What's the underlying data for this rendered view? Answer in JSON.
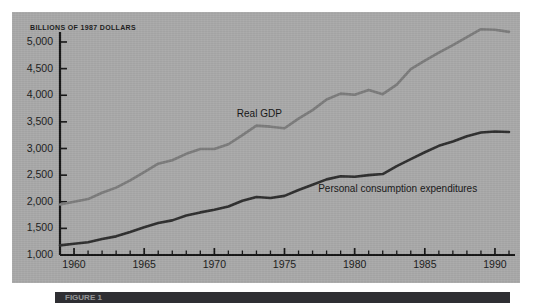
{
  "figure": {
    "panel_background": "#a9a9a9",
    "page_background": "#ffffff",
    "caption_bar_color": "#2f2f33",
    "caption_partial_text": "FIGURE 1"
  },
  "chart_data": {
    "type": "line",
    "title": "",
    "subtitle": "",
    "axis_note": "BILLIONS OF 1987 DOLLARS",
    "xlabel": "",
    "ylabel": "",
    "xlim": [
      1959,
      1991
    ],
    "ylim": [
      1000,
      5000
    ],
    "ytick_step": 500,
    "grid": false,
    "legend": "inline-labels",
    "ytick_labels": [
      "1,000",
      "1,500",
      "2,000",
      "2,500",
      "3,000",
      "3,500",
      "4,000",
      "4,500",
      "5,000"
    ],
    "ytick_values": [
      1000,
      1500,
      2000,
      2500,
      3000,
      3500,
      4000,
      4500,
      5000
    ],
    "xtick_labels": [
      "1960",
      "1965",
      "1970",
      "1975",
      "1980",
      "1985",
      "1990"
    ],
    "xtick_values": [
      1960,
      1965,
      1970,
      1975,
      1980,
      1985,
      1990
    ],
    "xtick_minor_step": 1,
    "x": [
      1959,
      1960,
      1961,
      1962,
      1963,
      1964,
      1965,
      1966,
      1967,
      1968,
      1969,
      1970,
      1971,
      1972,
      1973,
      1974,
      1975,
      1976,
      1977,
      1978,
      1979,
      1980,
      1981,
      1982,
      1983,
      1984,
      1985,
      1986,
      1987,
      1988,
      1989,
      1990,
      1991
    ],
    "series": [
      {
        "name": "Real GDP",
        "color": "#7c7c7c",
        "label_x": 1971.6,
        "label_y": 3620,
        "values": [
          1950,
          2000,
          2050,
          2170,
          2265,
          2400,
          2555,
          2715,
          2780,
          2900,
          2990,
          2990,
          3080,
          3250,
          3430,
          3410,
          3380,
          3560,
          3720,
          3920,
          4030,
          4010,
          4100,
          4020,
          4200,
          4490,
          4650,
          4800,
          4940,
          5090,
          5240,
          5230,
          5190
        ],
        "notes": "1973 peak with 1974-75 recession dip; 1979-82 plateau with 1982 recession dip; flattening 1990-91"
      },
      {
        "name": "Personal consumption expenditures",
        "color": "#2e2e2e",
        "label_x": 1977.4,
        "label_y": 2220,
        "values": [
          1180,
          1210,
          1240,
          1300,
          1350,
          1430,
          1520,
          1600,
          1650,
          1740,
          1800,
          1850,
          1910,
          2020,
          2090,
          2070,
          2110,
          2220,
          2320,
          2420,
          2480,
          2470,
          2500,
          2520,
          2670,
          2800,
          2930,
          3050,
          3130,
          3230,
          3300,
          3320,
          3310
        ],
        "notes": "steadier upward trend; mild flattening 1973-75 and 1979-82; flat 1990-91"
      }
    ]
  }
}
